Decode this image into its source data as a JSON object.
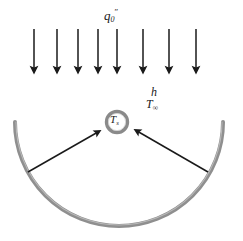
{
  "diagram": {
    "background_color": "#ffffff",
    "arc_color": "#8f8f8f",
    "sphere_ring_color": "#8a8a8a",
    "arrow_color": "#1a1a1a",
    "text_color": "#1a1a1a"
  },
  "labels": {
    "heat_flux": {
      "base": "q",
      "subscript": "0",
      "superscript": "″"
    },
    "convection_coefficient": "h",
    "ambient_temperature": {
      "base": "T",
      "subscript": "∞"
    },
    "surface_temperature": {
      "base": "T",
      "subscript": "s"
    }
  },
  "incident_flux_arrows": {
    "count": 8,
    "direction": "down",
    "tail_y": 29,
    "tip_y": 76,
    "x_positions": [
      34,
      57,
      78,
      98,
      117,
      143,
      169,
      196
    ]
  },
  "reflector_arc": {
    "shape": "semicircle",
    "center_x": 119,
    "center_y": 122,
    "radius": 104,
    "stroke_width": 4,
    "start_angle_deg": 180,
    "end_angle_deg": 360
  },
  "sphere": {
    "center_x": 117,
    "center_y": 122,
    "outer_radius": 12,
    "ring_width": 3.5,
    "fill": "#ffffff"
  },
  "pointer_arrows": [
    {
      "name": "left-pointer",
      "x1": 28,
      "y1": 172,
      "x2": 100,
      "y2": 131
    },
    {
      "name": "right-pointer",
      "x1": 208,
      "y1": 172,
      "x2": 135,
      "y2": 130
    }
  ]
}
